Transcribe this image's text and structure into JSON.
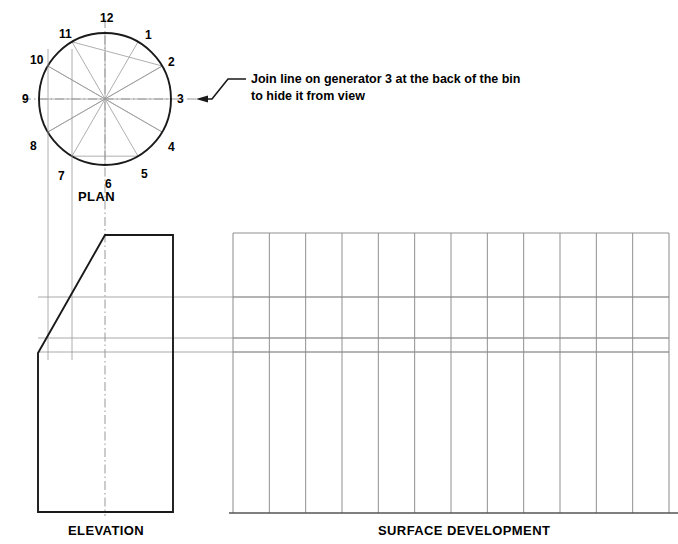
{
  "drawing": {
    "title_plan": "PLAN",
    "title_elevation": "ELEVATION",
    "title_surface": "SURFACE DEVELOPMENT",
    "annotation": {
      "line1": "Join line on generator 3 at the back of the bin",
      "line2": "to hide it from view"
    },
    "colors": {
      "outline": "#1a1a1a",
      "construction": "#9a9a9a",
      "centerline": "#8c8c8c",
      "grid": "#8a8a8a",
      "text": "#000000",
      "background": "#ffffff"
    },
    "plan": {
      "center_x": 105,
      "center_y": 99,
      "radius": 66,
      "generator_count": 12,
      "generator_labels": [
        "1",
        "2",
        "3",
        "4",
        "5",
        "6",
        "7",
        "8",
        "9",
        "10",
        "11",
        "12"
      ],
      "label_positions": [
        {
          "n": "12",
          "x": 105,
          "y": 18
        },
        {
          "n": "1",
          "x": 150,
          "y": 35
        },
        {
          "n": "2",
          "x": 173,
          "y": 62
        },
        {
          "n": "3",
          "x": 182,
          "y": 99
        },
        {
          "n": "4",
          "x": 173,
          "y": 147
        },
        {
          "n": "5",
          "x": 146,
          "y": 174
        },
        {
          "n": "6",
          "x": 110,
          "y": 184
        },
        {
          "n": "7",
          "x": 63,
          "y": 176
        },
        {
          "n": "8",
          "x": 35,
          "y": 146
        },
        {
          "n": "9",
          "x": 27,
          "y": 99
        },
        {
          "n": "10",
          "x": 35,
          "y": 60
        },
        {
          "n": "11",
          "x": 64,
          "y": 34
        }
      ]
    },
    "elevation": {
      "left_x": 38,
      "right_x": 173,
      "top_y": 235,
      "bottom_y": 512,
      "slope_start_x": 105,
      "slope_end_y": 353,
      "projector_lines_x": [
        48,
        72,
        105
      ],
      "horizontal_lines_y": [
        297,
        338,
        352
      ]
    },
    "surface_development": {
      "left_x": 233,
      "right_x": 669,
      "top_y": 233,
      "bottom_y": 513,
      "column_count": 12,
      "horizontal_lines_y": [
        297,
        338,
        352
      ]
    }
  }
}
